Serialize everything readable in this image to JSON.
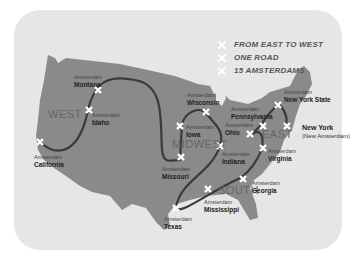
{
  "legend": {
    "items": [
      {
        "label": "FROM EAST TO WEST"
      },
      {
        "label": "ONE ROAD"
      },
      {
        "label": "15 AMSTERDAMS"
      }
    ]
  },
  "regions": {
    "west": "WEST",
    "midwest": "MIDWEST",
    "east": "EAST",
    "south": "SOUTH"
  },
  "places": [
    {
      "prefix": "Amsterdam",
      "state": "Montana"
    },
    {
      "prefix": "Amsterdam",
      "state": "Idaho"
    },
    {
      "prefix": "Amsterdam",
      "state": "California"
    },
    {
      "prefix": "Amsterdam",
      "state": "Wisconsin"
    },
    {
      "prefix": "Amsterdam",
      "state": "Iowa"
    },
    {
      "prefix": "Amsterdam",
      "state": "Missouri"
    },
    {
      "prefix": "Amsterdam",
      "state": "Indiana"
    },
    {
      "prefix": "Amsterdam",
      "state": "Pennsylvania"
    },
    {
      "prefix": "Amsterdam",
      "state": "Ohio"
    },
    {
      "prefix": "Amsterdam",
      "state": "New York State"
    },
    {
      "prefix": "Amsterdam",
      "state": "Virginia"
    },
    {
      "prefix": "Amsterdam",
      "state": "Georgia"
    },
    {
      "prefix": "Amsterdam",
      "state": "Mississippi"
    },
    {
      "prefix": "Amsterdam",
      "state": "Texas"
    }
  ],
  "new_york": {
    "name": "New York",
    "sub": "(New Amsterdam)"
  },
  "colors": {
    "land": "#8a8a8a",
    "background": "#e6e6e6",
    "road": "#3a3a3a",
    "marker": "#ffffff"
  }
}
